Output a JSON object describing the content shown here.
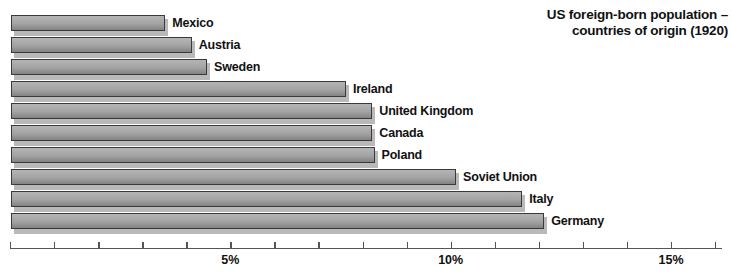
{
  "chart_data": {
    "type": "bar",
    "orientation": "horizontal",
    "title": "US foreign-born population – countries of origin (1920)",
    "title_lines": [
      "US foreign-born population –",
      "countries of origin (1920)"
    ],
    "xlabel": "",
    "ylabel": "",
    "categories": [
      "Mexico",
      "Austria",
      "Sweden",
      "Ireland",
      "United Kingdom",
      "Canada",
      "Poland",
      "Soviet Union",
      "Italy",
      "Germany"
    ],
    "values": [
      3.5,
      4.1,
      4.45,
      7.6,
      8.2,
      8.2,
      8.25,
      10.1,
      11.6,
      12.1
    ],
    "value_unit": "%",
    "xlim": [
      0,
      16.1
    ],
    "xticks": [
      0,
      1,
      2,
      3,
      4,
      5,
      6,
      7,
      8,
      9,
      10,
      11,
      12,
      13,
      14,
      15,
      16
    ],
    "xtick_labels": [
      "",
      "",
      "",
      "",
      "",
      "5%",
      "",
      "",
      "",
      "",
      "10%",
      "",
      "",
      "",
      "",
      "15%",
      ""
    ],
    "major_ticks": [
      5,
      10,
      15
    ],
    "grid": false,
    "legend": null,
    "bar_fill_top_color": "#b4b4b4",
    "bar_fill_bottom_color": "#828282",
    "bar_border_color": "#3a3a3a",
    "bar_shadow_color": "#b9b9b9",
    "axis_color": "#555555",
    "text_color": "#111111",
    "background_color": "#ffffff"
  }
}
